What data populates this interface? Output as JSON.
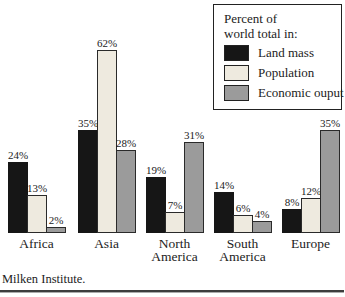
{
  "chart_data": {
    "type": "bar",
    "title": "Percent of world total in:",
    "categories": [
      "Africa",
      "Asia",
      "North America",
      "South America",
      "Europe"
    ],
    "series": [
      {
        "name": "Land mass",
        "key": "landmass",
        "color": "#161616",
        "values": [
          24,
          35,
          19,
          14,
          8
        ]
      },
      {
        "name": "Population",
        "key": "population",
        "color": "#eeeadf",
        "values": [
          13,
          62,
          7,
          6,
          12
        ]
      },
      {
        "name": "Economic ouput",
        "key": "economic",
        "color": "#9b9b9b",
        "values": [
          2,
          28,
          31,
          4,
          35
        ]
      }
    ],
    "groups": [
      {
        "category_lines": [
          "Africa"
        ],
        "labels": [
          "24%",
          "13%",
          "2%"
        ],
        "values": [
          24,
          13,
          2
        ]
      },
      {
        "category_lines": [
          "Asia"
        ],
        "labels": [
          "35%",
          "62%",
          "28%"
        ],
        "values": [
          35,
          62,
          28
        ]
      },
      {
        "category_lines": [
          "North",
          "America"
        ],
        "labels": [
          "19%",
          "7%",
          "31%"
        ],
        "values": [
          19,
          7,
          31
        ]
      },
      {
        "category_lines": [
          "South",
          "America"
        ],
        "labels": [
          "14%",
          "6%",
          "4%"
        ],
        "values": [
          14,
          6,
          4
        ]
      },
      {
        "category_lines": [
          "Europe"
        ],
        "labels": [
          "8%",
          "12%",
          "35%"
        ],
        "values": [
          8,
          12,
          35
        ]
      }
    ],
    "ylim": [
      0,
      65
    ],
    "grid": false,
    "legend_position": "top-right",
    "data_labels": true
  },
  "legend": {
    "title_line1": "Percent of",
    "title_line2": "world total in:",
    "items": [
      {
        "label": "Land mass"
      },
      {
        "label": "Population"
      },
      {
        "label": "Economic ouput"
      }
    ]
  },
  "footer": {
    "source": "Milken Institute."
  }
}
